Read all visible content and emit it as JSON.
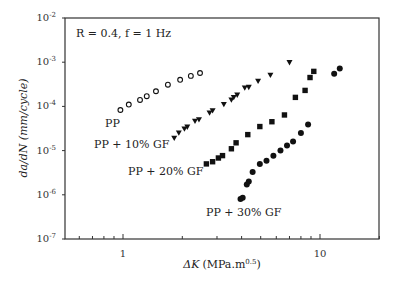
{
  "chart_data": {
    "type": "scatter",
    "title": "",
    "xlabel": "ΔK (MPa.m^0.5)",
    "ylabel": "da/dN (mm/cycle)",
    "xscale": "log",
    "yscale": "log",
    "xlim": [
      0.5,
      20
    ],
    "ylim": [
      1e-07,
      0.01
    ],
    "x_ticks": [
      "1",
      "10"
    ],
    "y_ticks": [
      "10^-7",
      "10^-6",
      "10^-5",
      "10^-4",
      "10^-3",
      "10^-2"
    ],
    "grid": false,
    "legend": null,
    "annotations": [
      "R = 0.4, f = 1 Hz",
      "PP",
      "PP + 10% GF",
      "PP + 20% GF",
      "PP + 30% GF"
    ],
    "series": [
      {
        "name": "PP",
        "marker": "open-circle",
        "x": [
          0.97,
          1.07,
          1.22,
          1.32,
          1.47,
          1.69,
          1.95,
          2.21,
          2.46
        ],
        "y": [
          8.3e-05,
          0.00011,
          0.00014,
          0.00017,
          0.00022,
          0.00031,
          0.0004,
          0.00049,
          0.00057
        ]
      },
      {
        "name": "PP + 10% GF",
        "marker": "filled-triangle-down",
        "x": [
          1.82,
          1.92,
          2.05,
          2.12,
          2.32,
          2.43,
          2.75,
          2.85,
          3.25,
          3.55,
          3.65,
          3.8,
          4.15,
          4.35,
          4.85,
          5.6,
          7.0
        ],
        "y": [
          1.9e-05,
          2.5e-05,
          3.1e-05,
          3.4e-05,
          4.6e-05,
          5e-05,
          7.1e-05,
          8e-05,
          0.00011,
          0.00014,
          0.00016,
          0.00018,
          0.00026,
          0.00027,
          0.00037,
          0.00051,
          0.00098
        ]
      },
      {
        "name": "PP + 20% GF",
        "marker": "filled-square",
        "x": [
          2.65,
          2.85,
          3.05,
          3.2,
          3.55,
          3.75,
          4.3,
          4.95,
          5.7,
          6.6,
          7.5,
          8.4,
          8.9,
          9.3
        ],
        "y": [
          5e-06,
          5.6e-06,
          6.8e-06,
          7.7e-06,
          1.1e-05,
          1.5e-05,
          2.3e-05,
          3.5e-05,
          4.5e-05,
          6.4e-05,
          0.00016,
          0.00023,
          0.00045,
          0.00062
        ]
      },
      {
        "name": "PP + 30% GF",
        "marker": "filled-circle",
        "x": [
          3.95,
          4.05,
          4.25,
          4.35,
          4.55,
          4.95,
          5.35,
          5.8,
          6.3,
          6.8,
          7.3,
          8.0,
          8.7,
          11.8,
          12.6
        ],
        "y": [
          8e-07,
          8.6e-07,
          1.7e-06,
          2e-06,
          3.3e-06,
          5e-06,
          5.9e-06,
          7.6e-06,
          1e-05,
          1.3e-05,
          1.6e-05,
          2.5e-05,
          3.9e-05,
          0.00055,
          0.00072
        ]
      }
    ]
  },
  "labels": {
    "condition": "R = 0.4, f = 1 Hz",
    "pp": "PP",
    "pp10": "PP + 10% GF",
    "pp20": "PP + 20% GF",
    "pp30": "PP + 30% GF",
    "x_tick_1": "1",
    "x_tick_10": "10",
    "xlabel_delta": "ΔK",
    "xlabel_units": "(MPa.m",
    "xlabel_exp": "0.5",
    "xlabel_close": ")",
    "ylabel": "da/dN (mm/cycle)"
  }
}
